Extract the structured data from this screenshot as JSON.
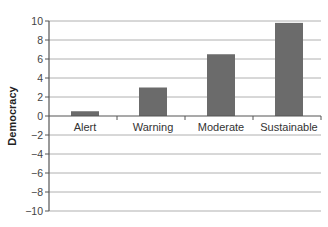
{
  "chart_data": {
    "type": "bar",
    "title": "",
    "xlabel": "",
    "ylabel": "Democracy",
    "categories": [
      "Alert",
      "Warning",
      "Moderate",
      "Sustainable"
    ],
    "values": [
      0.5,
      3.0,
      6.5,
      9.8
    ],
    "ylim": [
      -10,
      10
    ],
    "yticks": [
      10,
      8,
      6,
      4,
      2,
      0,
      -2,
      -4,
      -6,
      -8,
      -10
    ],
    "ytick_labels": [
      "10",
      "8",
      "6",
      "4",
      "2",
      "0",
      "−2",
      "−4",
      "−6",
      "−8",
      "−10"
    ],
    "grid": true,
    "legend": null,
    "bar_color": "#6b6b6b",
    "grid_color": "#b0b0b0",
    "axis_color": "#555555"
  }
}
